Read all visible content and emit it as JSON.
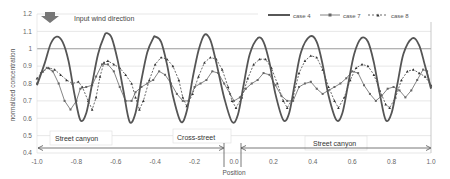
{
  "chart_data": {
    "type": "line",
    "title": "",
    "xlabel": "Position",
    "ylabel": "normalized concentration",
    "xlim": [
      -1.0,
      1.0
    ],
    "ylim": [
      0.4,
      1.2
    ],
    "x_ticks": [
      "-1.0",
      "-0.8",
      "-0.6",
      "-0.4",
      "-0.2",
      "0.0",
      "0.2",
      "0.4",
      "0.6",
      "0.8",
      "1.0"
    ],
    "y_ticks": [
      "0.4",
      "0.5",
      "0.6",
      "0.7",
      "0.8",
      "0.9",
      "1",
      "1.1",
      "1.2"
    ],
    "grid": true,
    "legend_position": "top-right",
    "annotations": {
      "wind": "Input wind direction",
      "region_left": "Street canyon",
      "region_middle": "Cross-street",
      "region_right": "Street canyon"
    },
    "series": [
      {
        "name": "case 4",
        "style": "solid thick line",
        "color": "#555555",
        "points": [
          [
            -1.0,
            0.79
          ],
          [
            -0.96,
            0.92
          ],
          [
            -0.93,
            1.03
          ],
          [
            -0.9,
            1.07
          ],
          [
            -0.87,
            1.04
          ],
          [
            -0.84,
            0.93
          ],
          [
            -0.81,
            0.74
          ],
          [
            -0.78,
            0.59
          ],
          [
            -0.75,
            0.63
          ],
          [
            -0.72,
            0.8
          ],
          [
            -0.69,
            0.97
          ],
          [
            -0.66,
            1.07
          ],
          [
            -0.645,
            1.09
          ],
          [
            -0.62,
            1.06
          ],
          [
            -0.59,
            0.93
          ],
          [
            -0.56,
            0.75
          ],
          [
            -0.53,
            0.58
          ],
          [
            -0.5,
            0.63
          ],
          [
            -0.47,
            0.82
          ],
          [
            -0.44,
            0.98
          ],
          [
            -0.41,
            1.06
          ],
          [
            -0.4,
            1.07
          ],
          [
            -0.37,
            1.04
          ],
          [
            -0.34,
            0.91
          ],
          [
            -0.31,
            0.73
          ],
          [
            -0.27,
            0.58
          ],
          [
            -0.24,
            0.64
          ],
          [
            -0.21,
            0.83
          ],
          [
            -0.18,
            0.99
          ],
          [
            -0.15,
            1.08
          ],
          [
            -0.12,
            1.05
          ],
          [
            -0.09,
            0.92
          ],
          [
            -0.05,
            0.72
          ],
          [
            -0.01,
            0.58
          ],
          [
            0.02,
            0.62
          ],
          [
            0.05,
            0.8
          ],
          [
            0.08,
            0.97
          ],
          [
            0.12,
            1.06
          ],
          [
            0.15,
            1.04
          ],
          [
            0.18,
            0.92
          ],
          [
            0.21,
            0.74
          ],
          [
            0.25,
            0.59
          ],
          [
            0.28,
            0.63
          ],
          [
            0.31,
            0.81
          ],
          [
            0.34,
            0.98
          ],
          [
            0.385,
            1.07
          ],
          [
            0.42,
            1.04
          ],
          [
            0.45,
            0.91
          ],
          [
            0.48,
            0.73
          ],
          [
            0.52,
            0.59
          ],
          [
            0.55,
            0.63
          ],
          [
            0.58,
            0.8
          ],
          [
            0.61,
            0.97
          ],
          [
            0.645,
            1.06
          ],
          [
            0.68,
            1.04
          ],
          [
            0.71,
            0.92
          ],
          [
            0.74,
            0.74
          ],
          [
            0.77,
            0.59
          ],
          [
            0.8,
            0.63
          ],
          [
            0.83,
            0.8
          ],
          [
            0.86,
            0.97
          ],
          [
            0.905,
            1.06
          ],
          [
            0.94,
            1.02
          ],
          [
            0.97,
            0.9
          ],
          [
            1.0,
            0.77
          ]
        ]
      },
      {
        "name": "case 7",
        "style": "thin line with small markers",
        "color": "#666666",
        "points": [
          [
            -1.0,
            0.8
          ],
          [
            -0.98,
            0.86
          ],
          [
            -0.95,
            0.89
          ],
          [
            -0.92,
            0.87
          ],
          [
            -0.89,
            0.8
          ],
          [
            -0.86,
            0.7
          ],
          [
            -0.83,
            0.65
          ],
          [
            -0.8,
            0.7
          ],
          [
            -0.78,
            0.77
          ],
          [
            -0.75,
            0.78
          ],
          [
            -0.72,
            0.79
          ],
          [
            -0.7,
            0.84
          ],
          [
            -0.67,
            0.91
          ],
          [
            -0.64,
            0.91
          ],
          [
            -0.61,
            0.87
          ],
          [
            -0.58,
            0.78
          ],
          [
            -0.55,
            0.7
          ],
          [
            -0.52,
            0.7
          ],
          [
            -0.5,
            0.75
          ],
          [
            -0.47,
            0.78
          ],
          [
            -0.44,
            0.8
          ],
          [
            -0.41,
            0.82
          ],
          [
            -0.38,
            0.87
          ],
          [
            -0.35,
            0.85
          ],
          [
            -0.32,
            0.8
          ],
          [
            -0.29,
            0.74
          ],
          [
            -0.26,
            0.7
          ],
          [
            -0.23,
            0.7
          ],
          [
            -0.2,
            0.78
          ],
          [
            -0.17,
            0.8
          ],
          [
            -0.14,
            0.82
          ],
          [
            -0.11,
            0.87
          ],
          [
            -0.08,
            0.86
          ],
          [
            -0.05,
            0.8
          ],
          [
            -0.02,
            0.74
          ],
          [
            0.0,
            0.7
          ],
          [
            0.03,
            0.72
          ],
          [
            0.06,
            0.77
          ],
          [
            0.09,
            0.8
          ],
          [
            0.12,
            0.82
          ],
          [
            0.15,
            0.86
          ],
          [
            0.18,
            0.85
          ],
          [
            0.21,
            0.79
          ],
          [
            0.24,
            0.73
          ],
          [
            0.27,
            0.7
          ],
          [
            0.3,
            0.7
          ],
          [
            0.33,
            0.78
          ],
          [
            0.36,
            0.8
          ],
          [
            0.39,
            0.81
          ],
          [
            0.42,
            0.77
          ],
          [
            0.45,
            0.74
          ],
          [
            0.48,
            0.76
          ],
          [
            0.51,
            0.78
          ],
          [
            0.54,
            0.8
          ],
          [
            0.57,
            0.83
          ],
          [
            0.6,
            0.87
          ],
          [
            0.63,
            0.86
          ],
          [
            0.66,
            0.79
          ],
          [
            0.69,
            0.74
          ],
          [
            0.72,
            0.7
          ],
          [
            0.75,
            0.73
          ],
          [
            0.78,
            0.77
          ],
          [
            0.81,
            0.78
          ],
          [
            0.84,
            0.76
          ],
          [
            0.87,
            0.72
          ],
          [
            0.9,
            0.76
          ],
          [
            0.93,
            0.82
          ],
          [
            0.96,
            0.88
          ],
          [
            0.98,
            0.87
          ],
          [
            1.0,
            0.78
          ]
        ]
      },
      {
        "name": "case 8",
        "style": "dashed line with triangle markers",
        "color": "#444444",
        "points": [
          [
            -1.0,
            0.83
          ],
          [
            -0.97,
            0.87
          ],
          [
            -0.94,
            0.89
          ],
          [
            -0.91,
            0.88
          ],
          [
            -0.88,
            0.85
          ],
          [
            -0.85,
            0.82
          ],
          [
            -0.82,
            0.8
          ],
          [
            -0.79,
            0.81
          ],
          [
            -0.77,
            0.78
          ],
          [
            -0.74,
            0.7
          ],
          [
            -0.72,
            0.65
          ],
          [
            -0.7,
            0.72
          ],
          [
            -0.68,
            0.84
          ],
          [
            -0.66,
            0.92
          ],
          [
            -0.64,
            0.93
          ],
          [
            -0.61,
            0.91
          ],
          [
            -0.58,
            0.89
          ],
          [
            -0.55,
            0.85
          ],
          [
            -0.52,
            0.8
          ],
          [
            -0.5,
            0.72
          ],
          [
            -0.48,
            0.65
          ],
          [
            -0.46,
            0.7
          ],
          [
            -0.43,
            0.82
          ],
          [
            -0.4,
            0.91
          ],
          [
            -0.37,
            0.95
          ],
          [
            -0.34,
            0.94
          ],
          [
            -0.31,
            0.9
          ],
          [
            -0.28,
            0.82
          ],
          [
            -0.26,
            0.72
          ],
          [
            -0.24,
            0.67
          ],
          [
            -0.21,
            0.74
          ],
          [
            -0.18,
            0.84
          ],
          [
            -0.15,
            0.92
          ],
          [
            -0.12,
            0.95
          ],
          [
            -0.09,
            0.94
          ],
          [
            -0.06,
            0.88
          ],
          [
            -0.03,
            0.78
          ],
          [
            -0.01,
            0.7
          ],
          [
            0.01,
            0.66
          ],
          [
            0.04,
            0.72
          ],
          [
            0.07,
            0.83
          ],
          [
            0.1,
            0.91
          ],
          [
            0.13,
            0.94
          ],
          [
            0.16,
            0.94
          ],
          [
            0.19,
            0.89
          ],
          [
            0.22,
            0.8
          ],
          [
            0.25,
            0.7
          ],
          [
            0.27,
            0.66
          ],
          [
            0.3,
            0.72
          ],
          [
            0.33,
            0.86
          ],
          [
            0.36,
            0.93
          ],
          [
            0.39,
            0.96
          ],
          [
            0.42,
            0.95
          ],
          [
            0.45,
            0.88
          ],
          [
            0.48,
            0.78
          ],
          [
            0.51,
            0.7
          ],
          [
            0.53,
            0.66
          ],
          [
            0.56,
            0.72
          ],
          [
            0.59,
            0.82
          ],
          [
            0.62,
            0.89
          ],
          [
            0.65,
            0.91
          ],
          [
            0.68,
            0.9
          ],
          [
            0.71,
            0.85
          ],
          [
            0.74,
            0.76
          ],
          [
            0.77,
            0.68
          ],
          [
            0.79,
            0.66
          ],
          [
            0.82,
            0.72
          ],
          [
            0.85,
            0.82
          ],
          [
            0.88,
            0.87
          ],
          [
            0.91,
            0.88
          ],
          [
            0.94,
            0.86
          ],
          [
            0.97,
            0.84
          ],
          [
            1.0,
            0.79
          ]
        ]
      }
    ]
  }
}
